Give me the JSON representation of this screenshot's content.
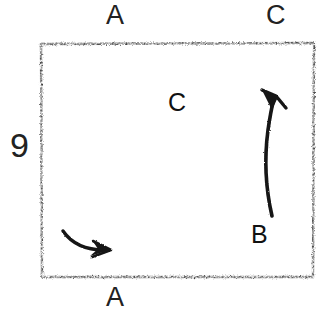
{
  "figure": {
    "number_label": "9",
    "domain": "hand-drawn-sketch",
    "background_color": "#ffffff",
    "ink_color": "#1b1b1b",
    "frame": {
      "name": "sketch-frame",
      "style": "rough hand-drawn rectangle",
      "x": 40,
      "y": 42,
      "width": 275,
      "height": 236
    }
  },
  "labels": {
    "top_a": "A",
    "top_c": "C",
    "left_number": "9",
    "bottom_a": "A",
    "inner_c": "C",
    "inner_b": "B"
  },
  "shapes": [
    {
      "name": "main-shaded-blob",
      "description": "large pencil-shaded wedge with V notch at left and pointed tail at lower right",
      "shading": "dense graphite stipple",
      "label": "C"
    },
    {
      "name": "lower-thin-wedge",
      "description": "thin elongated shaded sliver sloping up to the right",
      "shading": "light graphite stipple",
      "label": "A"
    }
  ],
  "arrows": [
    {
      "name": "arrow-bottom-left",
      "description": "short curved arrow pointing right and slightly down",
      "direction": "right"
    },
    {
      "name": "arrow-right-curved",
      "description": "tall curved arrow sweeping upward with arrowhead at top",
      "direction": "up",
      "label": "B"
    }
  ]
}
